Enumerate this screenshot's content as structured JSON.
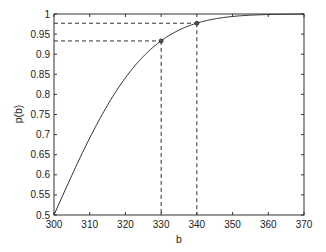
{
  "chart_data": {
    "type": "line",
    "title": "",
    "xlabel": "b",
    "ylabel": "p(b)",
    "xlim": [
      300,
      370
    ],
    "ylim": [
      0.5,
      1
    ],
    "grid": false,
    "legend": null,
    "x_ticks": [
      300,
      310,
      320,
      330,
      340,
      350,
      360,
      370
    ],
    "y_ticks": [
      0.5,
      0.55,
      0.6,
      0.65,
      0.7,
      0.75,
      0.8,
      0.85,
      0.9,
      0.95,
      1
    ],
    "x_tick_labels": [
      "300",
      "310",
      "320",
      "330",
      "340",
      "350",
      "360",
      "370"
    ],
    "y_tick_labels": [
      "0.5",
      "0.55",
      "0.6",
      "0.65",
      "0.7",
      "0.75",
      "0.8",
      "0.85",
      "0.9",
      "0.95",
      "1"
    ],
    "series": [
      {
        "name": "p(b)",
        "color": "#333333",
        "x": [
          300,
          305,
          310,
          315,
          320,
          325,
          330,
          335,
          340,
          345,
          350,
          355,
          360,
          365,
          370
        ],
        "values": [
          0.5,
          0.599,
          0.691,
          0.773,
          0.841,
          0.894,
          0.933,
          0.96,
          0.977,
          0.988,
          0.994,
          0.997,
          0.999,
          1.0,
          1.0
        ]
      }
    ],
    "annotations": [
      {
        "type": "marker",
        "x": 330,
        "y": 0.933,
        "dashed_guides": true
      },
      {
        "type": "marker",
        "x": 340,
        "y": 0.977,
        "dashed_guides": true
      }
    ]
  }
}
